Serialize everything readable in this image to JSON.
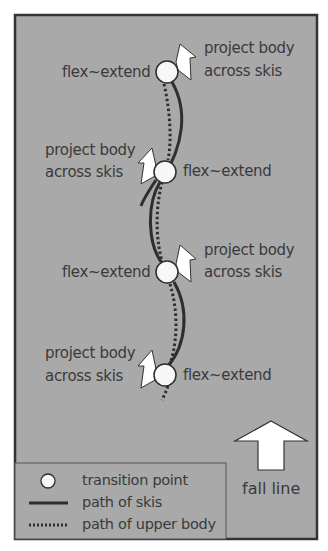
{
  "diagram": {
    "colors": {
      "background": "#a9a9a9",
      "border": "#333333",
      "ski_path": "#2e2e2e",
      "body_path": "#2e2e2e",
      "transition_fill": "#f7f7f7",
      "arrow_fill": "#ffffff",
      "text": "#3a3a3a"
    },
    "transitions": [
      {
        "id": 1,
        "action": "flex~extend",
        "projection_line1": "project body",
        "projection_line2": "across skis",
        "projection_side": "right"
      },
      {
        "id": 2,
        "action": "flex~extend",
        "projection_line1": "project body",
        "projection_line2": "across skis",
        "projection_side": "left"
      },
      {
        "id": 3,
        "action": "flex~extend",
        "projection_line1": "project body",
        "projection_line2": "across skis",
        "projection_side": "right"
      },
      {
        "id": 4,
        "action": "flex~extend",
        "projection_line1": "project body",
        "projection_line2": "across skis",
        "projection_side": "left"
      }
    ],
    "fall_line": {
      "label": "fall line"
    },
    "legend": {
      "items": [
        {
          "symbol": "circle",
          "label": "transition point"
        },
        {
          "symbol": "solid-line",
          "label": "path of skis"
        },
        {
          "symbol": "dotted-line",
          "label": "path of upper body"
        }
      ]
    }
  }
}
